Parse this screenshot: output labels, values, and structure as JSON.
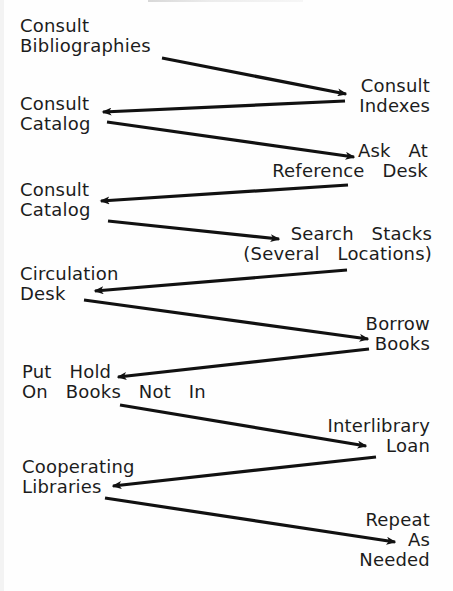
{
  "diagram": {
    "type": "flow-zigzag",
    "colors": {
      "background": "#fefefe",
      "text": "#1c1c1c",
      "arrow": "#111111"
    },
    "nodes": [
      {
        "id": "consult-bibliographies",
        "side": "left",
        "lines": [
          "Consult",
          "Bibliographies"
        ],
        "x": 20,
        "y": 16
      },
      {
        "id": "consult-indexes",
        "side": "right",
        "lines": [
          "Consult",
          "Indexes"
        ],
        "x": 430,
        "y": 76
      },
      {
        "id": "consult-catalog-1",
        "side": "left",
        "lines": [
          "Consult",
          "Catalog"
        ],
        "x": 20,
        "y": 94
      },
      {
        "id": "ask-at-reference-desk",
        "side": "right",
        "lines": [
          "Ask  At",
          "Reference  Desk"
        ],
        "x": 428,
        "y": 141
      },
      {
        "id": "consult-catalog-2",
        "side": "left",
        "lines": [
          "Consult",
          "Catalog"
        ],
        "x": 20,
        "y": 180
      },
      {
        "id": "search-stacks",
        "side": "right",
        "lines": [
          "Search  Stacks",
          "(Several  Locations)"
        ],
        "x": 432,
        "y": 224
      },
      {
        "id": "circulation-desk",
        "side": "left",
        "lines": [
          "Circulation",
          "Desk"
        ],
        "x": 20,
        "y": 264
      },
      {
        "id": "borrow-books",
        "side": "right",
        "lines": [
          "Borrow",
          "Books"
        ],
        "x": 430,
        "y": 314
      },
      {
        "id": "put-hold",
        "side": "left",
        "lines": [
          "Put  Hold",
          "On  Books  Not  In"
        ],
        "x": 22,
        "y": 362
      },
      {
        "id": "interlibrary-loan",
        "side": "right",
        "lines": [
          "Interlibrary",
          "Loan"
        ],
        "x": 430,
        "y": 416
      },
      {
        "id": "cooperating-libraries",
        "side": "left",
        "lines": [
          "Cooperating",
          "Libraries"
        ],
        "x": 22,
        "y": 457
      },
      {
        "id": "repeat-as-needed",
        "side": "right",
        "lines": [
          "Repeat",
          "As",
          "Needed"
        ],
        "x": 430,
        "y": 510
      }
    ],
    "edges": [
      {
        "from": "consult-bibliographies",
        "to": "consult-indexes",
        "x1": 162,
        "y1": 58,
        "x2": 346,
        "y2": 94
      },
      {
        "from": "consult-indexes",
        "to": "consult-catalog-1",
        "x1": 345,
        "y1": 101,
        "x2": 103,
        "y2": 112
      },
      {
        "from": "consult-catalog-1",
        "to": "ask-at-reference-desk",
        "x1": 107,
        "y1": 122,
        "x2": 354,
        "y2": 157
      },
      {
        "from": "ask-at-reference-desk",
        "to": "consult-catalog-2",
        "x1": 348,
        "y1": 185,
        "x2": 101,
        "y2": 201
      },
      {
        "from": "consult-catalog-2",
        "to": "search-stacks",
        "x1": 108,
        "y1": 221,
        "x2": 279,
        "y2": 239
      },
      {
        "from": "search-stacks",
        "to": "circulation-desk",
        "x1": 347,
        "y1": 270,
        "x2": 95,
        "y2": 291
      },
      {
        "from": "circulation-desk",
        "to": "borrow-books",
        "x1": 84,
        "y1": 300,
        "x2": 368,
        "y2": 339
      },
      {
        "from": "borrow-books",
        "to": "put-hold",
        "x1": 369,
        "y1": 349,
        "x2": 118,
        "y2": 377
      },
      {
        "from": "put-hold",
        "to": "interlibrary-loan",
        "x1": 120,
        "y1": 405,
        "x2": 366,
        "y2": 446
      },
      {
        "from": "interlibrary-loan",
        "to": "cooperating-libraries",
        "x1": 376,
        "y1": 457,
        "x2": 113,
        "y2": 486
      },
      {
        "from": "cooperating-libraries",
        "to": "repeat-as-needed",
        "x1": 105,
        "y1": 498,
        "x2": 395,
        "y2": 542
      }
    ]
  }
}
